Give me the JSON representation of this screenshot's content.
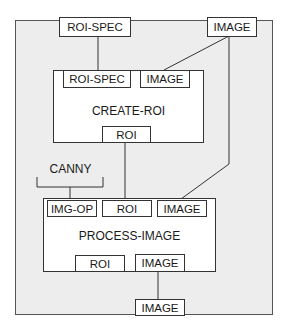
{
  "diagram": {
    "outer_inputs": {
      "roi_spec": "ROI-SPEC",
      "image": "IMAGE"
    },
    "outer_output": {
      "image": "IMAGE"
    },
    "create_roi": {
      "title": "CREATE-ROI",
      "inputs": [
        "ROI-SPEC",
        "IMAGE"
      ],
      "outputs": [
        "ROI"
      ]
    },
    "process_image": {
      "title": "PROCESS-IMAGE",
      "inputs": [
        "IMG-OP",
        "ROI",
        "IMAGE"
      ],
      "outputs": [
        "ROI",
        "IMAGE"
      ]
    },
    "constant": {
      "label": "CANNY"
    },
    "connections": [
      {
        "from": "outer.ROI-SPEC",
        "to": "CREATE-ROI.ROI-SPEC"
      },
      {
        "from": "outer.IMAGE",
        "to": "CREATE-ROI.IMAGE"
      },
      {
        "from": "outer.IMAGE",
        "to": "PROCESS-IMAGE.IMAGE"
      },
      {
        "from": "CREATE-ROI.ROI",
        "to": "PROCESS-IMAGE.ROI"
      },
      {
        "from": "CANNY",
        "to": "PROCESS-IMAGE.IMG-OP"
      },
      {
        "from": "PROCESS-IMAGE.IMAGE",
        "to": "outer.IMAGE(out)"
      }
    ],
    "colors": {
      "background": "#ffffff",
      "canvas_fill": "#ededed",
      "stroke": "#333333"
    }
  }
}
